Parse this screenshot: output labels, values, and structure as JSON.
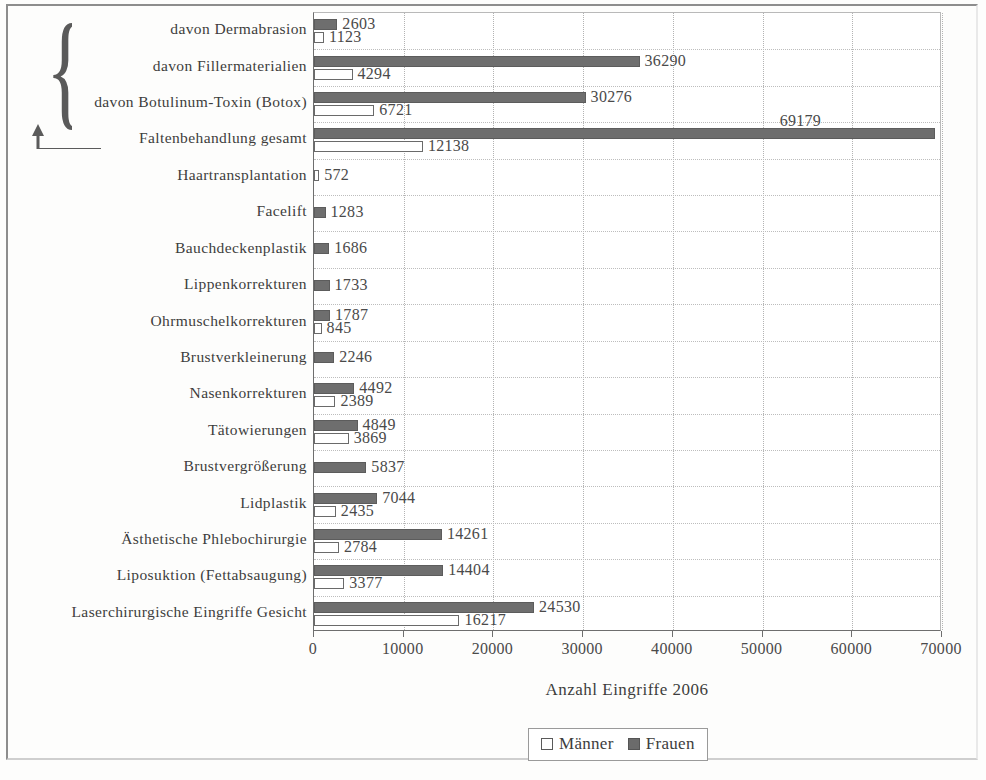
{
  "chart_data": {
    "type": "bar",
    "orientation": "horizontal",
    "title": "",
    "xlabel": "Anzahl Eingriffe 2006",
    "ylabel": "",
    "xlim": [
      0,
      70000
    ],
    "xticks": [
      "0",
      "10000",
      "20000",
      "30000",
      "40000",
      "50000",
      "60000",
      "70000"
    ],
    "xtick_values": [
      0,
      10000,
      20000,
      30000,
      40000,
      50000,
      60000,
      70000
    ],
    "grid": "vertical-and-horizontal-dotted",
    "legend_position": "bottom-center",
    "legend": [
      "Männer",
      "Frauen"
    ],
    "categories": [
      "davon Dermabrasion",
      "davon Fillermaterialien",
      "davon Botulinum-Toxin (Botox)",
      "Faltenbehandlung gesamt",
      "Haartransplantation",
      "Facelift",
      "Bauchdeckenplastik",
      "Lippenkorrekturen",
      "Ohrmuschelkorrekturen",
      "Brustverkleinerung",
      "Nasenkorrekturen",
      "Tätowierungen",
      "Brustvergrößerung",
      "Lidplastik",
      "Ästhetische Phlebochirurgie",
      "Liposuktion (Fettabsaugung)",
      "Laserchirurgische Eingriffe Gesicht"
    ],
    "series": [
      {
        "name": "Frauen",
        "color": "#6e6e6e",
        "values": [
          2603,
          36290,
          30276,
          69179,
          null,
          1283,
          1686,
          1733,
          1787,
          2246,
          4492,
          4849,
          5837,
          7044,
          14261,
          14404,
          24530
        ],
        "labels": [
          "2603",
          "36290",
          "30276",
          "69179",
          "",
          "1283",
          "1686",
          "1733",
          "1787",
          "2246",
          "4492",
          "4849",
          "5837",
          "7044",
          "14261",
          "14404",
          "24530"
        ]
      },
      {
        "name": "Männer",
        "color": "#ffffff",
        "values": [
          1123,
          4294,
          6721,
          12138,
          572,
          null,
          null,
          null,
          845,
          null,
          2389,
          3869,
          null,
          2435,
          2784,
          3377,
          16217
        ],
        "labels": [
          "1123",
          "4294",
          "6721",
          "12138",
          "572",
          "",
          "",
          "",
          "845",
          "",
          "2389",
          "3869",
          "",
          "2435",
          "2784",
          "3377",
          "16217"
        ]
      }
    ],
    "annotation": {
      "brace_glyph": "{",
      "brace_covers": [
        "davon Dermabrasion",
        "davon Fillermaterialien",
        "davon Botulinum-Toxin (Botox)"
      ],
      "arrow_points_to": "Faltenbehandlung gesamt"
    }
  },
  "colors": {
    "frauen": "#6e6e6e",
    "maenner": "#ffffff",
    "axis": "#6e6e6e",
    "grid": "#b3b3b3",
    "text": "#3d3d3d"
  }
}
